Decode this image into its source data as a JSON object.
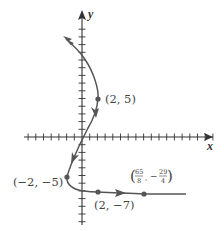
{
  "figure": {
    "type": "parametric-curve-plot",
    "axes": {
      "x_label": "x",
      "y_label": "y",
      "origin_px": [
        82,
        137
      ],
      "unit_px": 7.7,
      "x_ticks_min": -7,
      "x_ticks_max": 17,
      "y_ticks_min": -11,
      "y_ticks_max": 14
    },
    "colors": {
      "curve": "#555555",
      "axis": "#333333",
      "point": "#555555",
      "label": "#444444"
    },
    "points": [
      {
        "label": "(2, 5)",
        "x": 2,
        "y": 5
      },
      {
        "label": "(−2, −5)",
        "x": -2,
        "y": -5
      },
      {
        "label": "(2, −7)",
        "x": 2,
        "y": -7
      },
      {
        "label_num1": "65",
        "label_den1": "8",
        "label_num2": "29",
        "label_den2": "4",
        "x": 8.125,
        "y": -7.25
      }
    ]
  }
}
